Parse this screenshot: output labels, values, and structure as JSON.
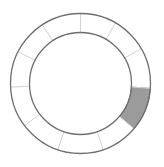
{
  "diagram": {
    "type": "segmented-ring",
    "center": [
      80.5,
      83.5
    ],
    "outer_radius": 70,
    "inner_radius": 51,
    "divider_angles_deg": [
      90,
      60,
      30,
      -4,
      -40,
      -71,
      -109,
      -143,
      -177,
      153,
      123
    ],
    "segments": [
      {
        "start": -40,
        "end": -4,
        "filled": true,
        "color": "#9b9b9b"
      }
    ],
    "colors": {
      "ring_stroke": "#6e6e6e",
      "divider_stroke": "#d2d2d2",
      "fill": "#9b9b9b",
      "background": "#ffffff"
    }
  }
}
